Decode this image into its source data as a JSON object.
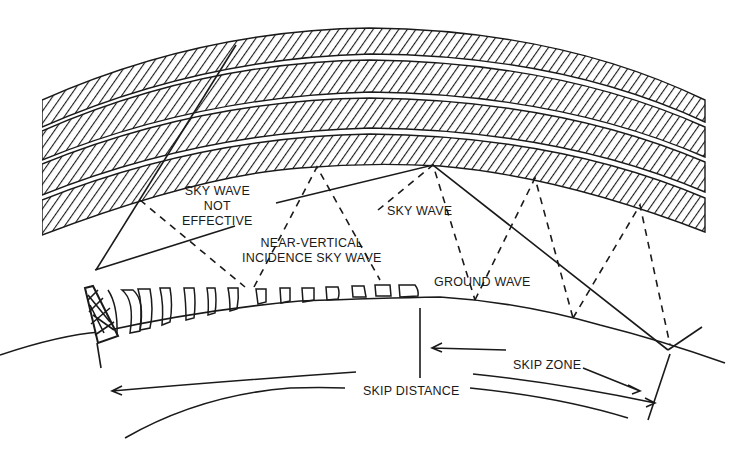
{
  "diagram": {
    "colors": {
      "ink": "#1a1a1a",
      "background": "#ffffff"
    },
    "labels": {
      "sky_wave_not_effective_1": "SKY WAVE",
      "sky_wave_not_effective_2": "NOT",
      "sky_wave_not_effective_3": "EFFECTIVE",
      "nvis_1": "NEAR-VERTICAL",
      "nvis_2": "INCIDENCE SKY WAVE",
      "sky_wave": "SKY WAVE",
      "ground_wave": "GROUND WAVE",
      "skip_zone": "SKIP ZONE",
      "skip_distance": "SKIP DISTANCE"
    },
    "elements": {
      "ionosphere_layers": 4,
      "antenna": "transmitting-tower",
      "earth_surface": "curved-ground-line"
    }
  }
}
